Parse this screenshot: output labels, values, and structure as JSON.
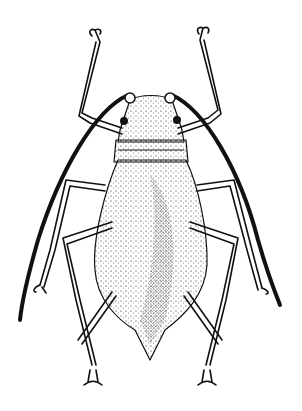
{
  "image": {
    "subject": "aphid",
    "style": "stippled black ink line illustration",
    "view": "dorsal",
    "background_color": "#ffffff",
    "ink_color": "#111111"
  }
}
